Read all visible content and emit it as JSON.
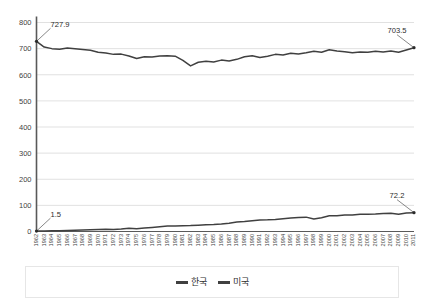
{
  "chart_data": {
    "type": "line",
    "title": "",
    "xlabel": "",
    "ylabel": "",
    "ylim": [
      0,
      800
    ],
    "ytick_labels": [
      "0",
      "100",
      "200",
      "300",
      "400",
      "500",
      "600",
      "700",
      "800"
    ],
    "ytick_values": [
      0,
      100,
      200,
      300,
      400,
      500,
      600,
      700,
      800
    ],
    "grid": true,
    "grid_axis": "y",
    "legend_position": "bottom",
    "categories": [
      "1962",
      "1963",
      "1964",
      "1965",
      "1966",
      "1967",
      "1968",
      "1969",
      "1970",
      "1971",
      "1972",
      "1973",
      "1974",
      "1975",
      "1976",
      "1977",
      "1978",
      "1979",
      "1980",
      "1981",
      "1982",
      "1983",
      "1984",
      "1985",
      "1986",
      "1987",
      "1988",
      "1989",
      "1990",
      "1991",
      "1992",
      "1993",
      "1994",
      "1995",
      "1996",
      "1997",
      "1998",
      "1999",
      "2000",
      "2001",
      "2002",
      "2003",
      "2004",
      "2005",
      "2006",
      "2007",
      "2008",
      "2009",
      "2010",
      "2011"
    ],
    "series": [
      {
        "name": "한국",
        "color": "#404040",
        "values": [
          1.5,
          2.0,
          2.4,
          2.8,
          3.6,
          4.4,
          5.4,
          6.6,
          7.8,
          8.4,
          8.0,
          9.5,
          12.0,
          11.0,
          13.0,
          15.5,
          18.5,
          21.0,
          21.5,
          22.0,
          22.5,
          24.0,
          26.0,
          27.0,
          29.0,
          32.0,
          36.0,
          38.0,
          41.0,
          44.0,
          44.5,
          46.0,
          49.0,
          52.0,
          54.0,
          55.0,
          48.0,
          53.0,
          60.0,
          60.5,
          63.0,
          63.5,
          66.0,
          66.5,
          67.0,
          69.0,
          70.0,
          66.0,
          71.0,
          72.2
        ]
      },
      {
        "name": "미국",
        "color": "#404040",
        "values": [
          727.9,
          706.0,
          700.0,
          698.0,
          702.0,
          700.0,
          697.0,
          694.0,
          686.0,
          683.0,
          678.0,
          679.0,
          672.0,
          662.0,
          669.0,
          668.0,
          672.0,
          673.0,
          671.0,
          655.0,
          634.0,
          648.0,
          652.0,
          649.0,
          656.0,
          653.0,
          659.0,
          669.0,
          673.0,
          666.0,
          671.0,
          678.0,
          676.0,
          682.0,
          679.0,
          684.0,
          690.0,
          686.0,
          696.0,
          691.0,
          688.0,
          684.0,
          687.0,
          686.0,
          690.0,
          687.0,
          691.0,
          686.0,
          695.0,
          703.5
        ]
      }
    ],
    "annotations": [
      {
        "text": "727.9",
        "series": "미국",
        "point_index": 0,
        "value": 727.9
      },
      {
        "text": "703.5",
        "series": "미국",
        "point_index": 49,
        "value": 703.5
      },
      {
        "text": "1.5",
        "series": "한국",
        "point_index": 0,
        "value": 1.5
      },
      {
        "text": "72.2",
        "series": "한국",
        "point_index": 49,
        "value": 72.2
      }
    ]
  },
  "legend": {
    "items": [
      {
        "label": "한국",
        "color": "#404040"
      },
      {
        "label": "미국",
        "color": "#404040"
      }
    ]
  }
}
